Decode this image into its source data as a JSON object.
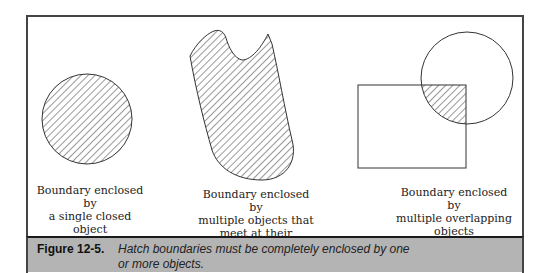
{
  "figure": {
    "number": "Figure 12-5.",
    "caption": "Hatch boundaries must be completely enclosed by one or more objects."
  },
  "examples": [
    {
      "id": "single",
      "label_lines": [
        "Boundary enclosed by",
        "a single closed object"
      ]
    },
    {
      "id": "endpoints",
      "label_lines": [
        "Boundary enclosed by",
        "multiple objects that",
        "meet at their endpoints"
      ]
    },
    {
      "id": "overlapping",
      "label_lines": [
        "Boundary enclosed by",
        "multiple overlapping",
        "objects"
      ]
    }
  ],
  "colors": {
    "line": "#333333",
    "caption_bg": "#b4b4b4",
    "frame": "#444444"
  }
}
